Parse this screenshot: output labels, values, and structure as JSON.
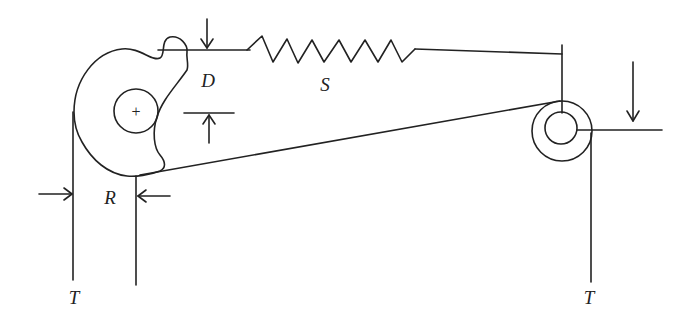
{
  "diagram": {
    "stroke_color": "#222222",
    "background": "#ffffff",
    "labels": {
      "displacement": "D",
      "spring": "S",
      "radius": "R",
      "tension_left": "T",
      "tension_right": "T",
      "pivot_marker": "+"
    }
  }
}
